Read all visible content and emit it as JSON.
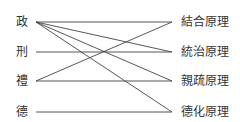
{
  "left_nodes": [
    {
      "label": "政",
      "y": 22
    },
    {
      "label": "刑",
      "y": 52
    },
    {
      "label": "禮",
      "y": 81
    },
    {
      "label": "德",
      "y": 112
    }
  ],
  "right_nodes": [
    {
      "label": "結合原理",
      "y": 22
    },
    {
      "label": "統治原理",
      "y": 52
    },
    {
      "label": "親疏原理",
      "y": 81
    },
    {
      "label": "德化原理",
      "y": 112
    }
  ],
  "edges": [
    {
      "from": "政",
      "to": "結合原理"
    },
    {
      "from": "政",
      "to": "統治原理"
    },
    {
      "from": "政",
      "to": "親疏原理"
    },
    {
      "from": "政",
      "to": "德化原理"
    },
    {
      "from": "刑",
      "to": "統治原理"
    },
    {
      "from": "禮",
      "to": "結合原理"
    },
    {
      "from": "禮",
      "to": "親疏原理"
    },
    {
      "from": "德",
      "to": "德化原理"
    }
  ]
}
